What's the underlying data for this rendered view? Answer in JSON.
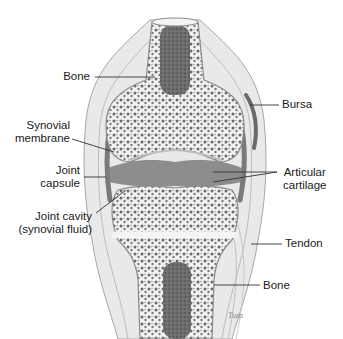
{
  "diagram": {
    "labels_left": [
      {
        "id": "bone-top",
        "text": "Bone"
      },
      {
        "id": "synovial-membrane",
        "line1": "Synovial",
        "line2": "membrane"
      },
      {
        "id": "joint-capsule",
        "line1": "Joint",
        "line2": "capsule"
      },
      {
        "id": "joint-cavity",
        "line1": "Joint cavity",
        "line2": "(synovial fluid)"
      }
    ],
    "labels_right": [
      {
        "id": "bursa",
        "text": "Bursa"
      },
      {
        "id": "articular-cartilage",
        "line1": "Articular",
        "line2": "cartilage"
      },
      {
        "id": "tendon",
        "text": "Tendon"
      },
      {
        "id": "bone-bottom",
        "text": "Bone"
      }
    ],
    "signature": "Tuza",
    "colors": {
      "outline": "#8a8a8a",
      "soft_tissue": "#e4e4e4",
      "bone_fill": "#f4f4f4",
      "spongy_bone": "#6a6a6a",
      "marrow": "#5a5a5a",
      "cavity": "#7a7a7a",
      "label_text": "#1a1a1a",
      "leader_line": "#333333"
    }
  }
}
